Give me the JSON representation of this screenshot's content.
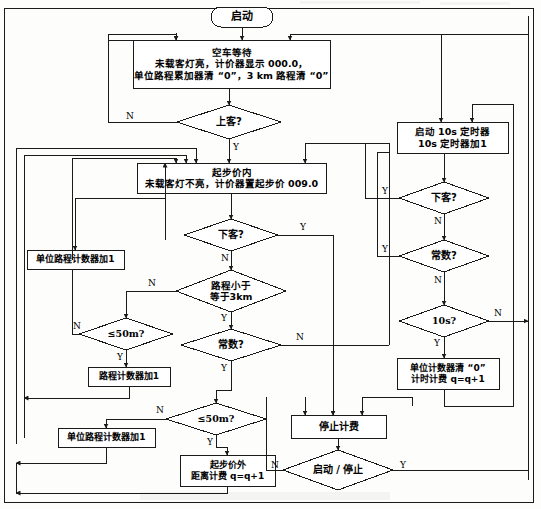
{
  "diagram": {
    "colors": {
      "stroke": "#1a1a1a",
      "fill": "#ffffff",
      "text": "#000000",
      "page": "#fdfdfc"
    }
  },
  "nodes": {
    "start": {
      "shape": "terminator",
      "lines": [
        "启动"
      ]
    },
    "idle_wait": {
      "shape": "process",
      "lines": [
        "空车等待",
        "未载客灯亮，计价器显示 000.0，",
        "单位路程累加器清 “0”，3 km 路程清 “0”"
      ]
    },
    "board_q": {
      "shape": "decision",
      "lines": [
        "上客?"
      ]
    },
    "base_fare": {
      "shape": "process",
      "lines": [
        "起步价内",
        "未载客灯不亮，计价器置起步价 009.0"
      ]
    },
    "alight_q_mid": {
      "shape": "decision",
      "lines": [
        "下客?"
      ]
    },
    "dist_le_3km_q": {
      "shape": "decision",
      "lines": [
        "路程小于",
        "等于3km"
      ]
    },
    "const_q_mid": {
      "shape": "decision",
      "lines": [
        "常数?"
      ]
    },
    "le50m_q_upper": {
      "shape": "decision",
      "lines": [
        "≤50m?"
      ]
    },
    "le50m_q_lower": {
      "shape": "decision",
      "lines": [
        "≤50m?"
      ]
    },
    "unit_dist_counter_inc_upper": {
      "shape": "process",
      "lines": [
        "单位路程计数器加1"
      ]
    },
    "dist_counter_inc": {
      "shape": "process",
      "lines": [
        "路程计数器加1"
      ]
    },
    "unit_dist_counter_inc_lower": {
      "shape": "process",
      "lines": [
        "单位路程计数器加1"
      ]
    },
    "over_base_fare": {
      "shape": "process",
      "lines": [
        "起步价外",
        "距离计费 q=q+1"
      ]
    },
    "timer_10s": {
      "shape": "process",
      "lines": [
        "启动 10s 定时器",
        "10s 定时器加1"
      ]
    },
    "alight_q_right": {
      "shape": "decision",
      "lines": [
        "下客?"
      ]
    },
    "const_q_right": {
      "shape": "decision",
      "lines": [
        "常数?"
      ]
    },
    "ten_s_q": {
      "shape": "decision",
      "lines": [
        "10s?"
      ]
    },
    "unit_counter_clear": {
      "shape": "process",
      "lines": [
        "单位计数器清 “0”",
        "计时计费 q=q+1"
      ]
    },
    "stop_billing": {
      "shape": "process",
      "lines": [
        "停止计费"
      ]
    },
    "start_stop_q": {
      "shape": "decision",
      "lines": [
        "启动 / 停止"
      ]
    }
  },
  "edge_labels": {
    "board_n": "N",
    "board_y": "Y",
    "alight_mid_y": "Y",
    "alight_mid_n": "N",
    "dist3km_n": "N",
    "dist3km_y": "Y",
    "const_mid_n": "N",
    "const_mid_y": "Y",
    "le50m_upper_n": "N",
    "le50m_upper_y": "Y",
    "le50m_lower_n": "N",
    "le50m_lower_y": "Y",
    "alight_right_y": "Y",
    "alight_right_n": "N",
    "const_right_y": "Y",
    "const_right_n": "N",
    "ten_s_n": "N",
    "ten_s_y": "Y",
    "start_stop_n": "N",
    "start_stop_y": "Y"
  }
}
